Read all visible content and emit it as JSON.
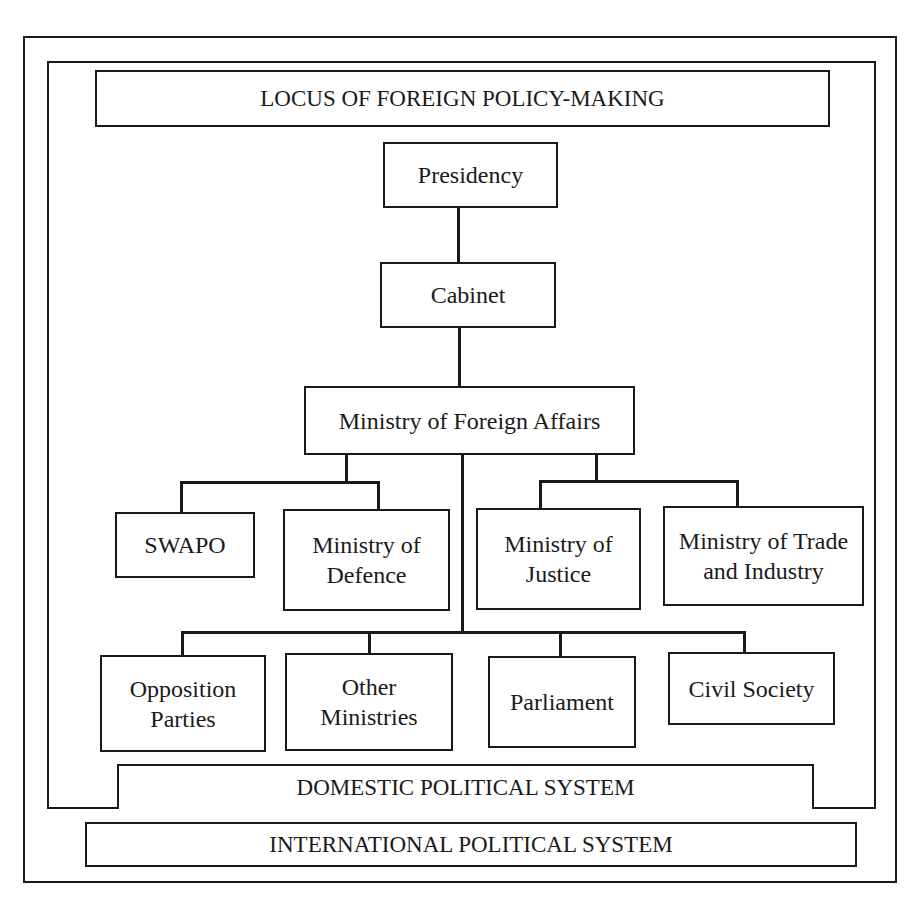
{
  "diagram": {
    "title": "LOCUS OF FOREIGN POLICY-MAKING",
    "domestic_system_label": "DOMESTIC POLITICAL SYSTEM",
    "international_system_label": "INTERNATIONAL POLITICAL SYSTEM",
    "nodes": {
      "presidency": "Presidency",
      "cabinet": "Cabinet",
      "mofa": "Ministry of Foreign Affairs",
      "swapo": "SWAPO",
      "defence": "Ministry of\nDefence",
      "justice": "Ministry of\nJustice",
      "trade": "Ministry of Trade\nand Industry",
      "opposition": "Opposition\nParties",
      "other_ministries": "Other\nMinistries",
      "parliament": "Parliament",
      "civil_society": "Civil Society"
    },
    "hierarchy": [
      {
        "from": "Presidency",
        "to": "Cabinet"
      },
      {
        "from": "Cabinet",
        "to": "Ministry of Foreign Affairs"
      },
      {
        "from": "Ministry of Foreign Affairs",
        "to": [
          "SWAPO",
          "Ministry of Defence"
        ]
      },
      {
        "from": "Ministry of Foreign Affairs",
        "to": [
          "Ministry of Justice",
          "Ministry of Trade and Industry"
        ]
      },
      {
        "from": "Ministry of Foreign Affairs",
        "to": [
          "Opposition Parties",
          "Other Ministries",
          "Parliament",
          "Civil Society"
        ]
      }
    ]
  }
}
